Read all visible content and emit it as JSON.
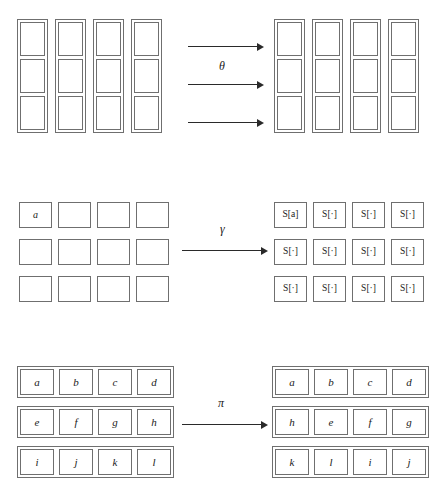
{
  "figure": {
    "type": "transformation-diagram",
    "background_color": "#ffffff",
    "stroke_color": "#6f6f6f",
    "arrow_color": "#2a2a2a",
    "sections": [
      {
        "id": "theta",
        "label": "θ",
        "arrow_count": 3,
        "left": {
          "layout": "columns",
          "columns": 4,
          "rows": 3,
          "cells": [
            [
              "",
              "",
              ""
            ],
            [
              "",
              "",
              ""
            ],
            [
              "",
              "",
              ""
            ],
            [
              "",
              "",
              ""
            ]
          ]
        },
        "right": {
          "layout": "columns",
          "columns": 4,
          "rows": 3,
          "cells": [
            [
              "",
              "",
              ""
            ],
            [
              "",
              "",
              ""
            ],
            [
              "",
              "",
              ""
            ],
            [
              "",
              "",
              ""
            ]
          ]
        }
      },
      {
        "id": "gamma",
        "label": "γ",
        "arrow_count": 1,
        "left": {
          "layout": "loose-grid",
          "rows": [
            [
              "a",
              "",
              "",
              ""
            ],
            [
              "",
              "",
              "",
              ""
            ],
            [
              "",
              "",
              "",
              ""
            ]
          ]
        },
        "right": {
          "layout": "loose-grid",
          "rows": [
            [
              "S[a]",
              "S[·]",
              "S[·]",
              "S[·]"
            ],
            [
              "S[·]",
              "S[·]",
              "S[·]",
              "S[·]"
            ],
            [
              "S[·]",
              "S[·]",
              "S[·]",
              "S[·]"
            ]
          ]
        }
      },
      {
        "id": "pi",
        "label": "π",
        "arrow_count": 1,
        "left": {
          "layout": "row-boxes",
          "rows": [
            [
              "a",
              "b",
              "c",
              "d"
            ],
            [
              "e",
              "f",
              "g",
              "h"
            ],
            [
              "i",
              "j",
              "k",
              "l"
            ]
          ]
        },
        "right": {
          "layout": "row-boxes",
          "rows": [
            [
              "a",
              "b",
              "c",
              "d"
            ],
            [
              "h",
              "e",
              "f",
              "g"
            ],
            [
              "k",
              "l",
              "i",
              "j"
            ]
          ]
        }
      }
    ]
  }
}
